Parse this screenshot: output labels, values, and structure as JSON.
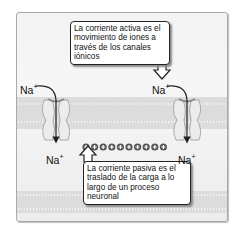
{
  "diagram": {
    "callouts": {
      "active_current": {
        "lines": [
          "La corriente activa es el",
          "movimiento de iones a",
          "través de los canales",
          "iónicos"
        ]
      },
      "passive_current": {
        "lines": [
          "La corriente pasiva es el",
          "traslado de la carga a lo",
          "largo de un proceso",
          "neuronal"
        ]
      }
    },
    "ion_labels": {
      "left_top": "Na+",
      "left_bottom": "Na+",
      "right_top": "Na+",
      "right_bottom": "Na+"
    },
    "charges": {
      "symbol": "+",
      "count": 10
    },
    "channels": [
      "left-ion-channel",
      "right-ion-channel"
    ],
    "colors": {
      "background": "#f3f3f3",
      "membrane": "#dcdcdc",
      "channel": "#e6e6e6",
      "arrow": "#222222",
      "charge": "#555555"
    }
  }
}
